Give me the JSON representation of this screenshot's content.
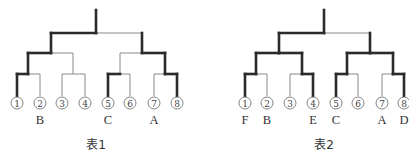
{
  "figures": [
    {
      "caption": "表1",
      "leaf_x": [
        17,
        40,
        62,
        85,
        108,
        130,
        154,
        177
      ],
      "pair_x": [
        28,
        73,
        120,
        165
      ],
      "semi_x": [
        51,
        142
      ],
      "root_x": 96,
      "seeds": [
        "1",
        "2",
        "3",
        "4",
        "5",
        "6",
        "7",
        "8"
      ],
      "teams": [
        "",
        "B",
        "",
        "",
        "C",
        "",
        "A",
        ""
      ],
      "winner_path": {
        "pairs": [
          "left",
          null,
          "left",
          "right"
        ],
        "semis": [
          "left",
          "right"
        ],
        "final": "left"
      }
    },
    {
      "caption": "表2",
      "leaf_x": [
        245,
        267,
        290,
        313,
        336,
        358,
        382,
        404
      ],
      "pair_x": [
        256,
        302,
        347,
        393
      ],
      "semi_x": [
        279,
        370
      ],
      "root_x": 324,
      "seeds": [
        "1",
        "2",
        "3",
        "4",
        "5",
        "6",
        "7",
        "8"
      ],
      "teams": [
        "F",
        "B",
        "",
        "E",
        "C",
        "",
        "A",
        "D"
      ],
      "winner_path": {
        "pairs": [
          "left",
          "right",
          "left",
          "right"
        ],
        "semis": [
          "both",
          "both"
        ],
        "final": "left"
      }
    }
  ],
  "layout": {
    "root_top_y": 10,
    "level1_y": 33,
    "level2_y": 53,
    "level3_y": 74,
    "leaf_bottom_y": 96,
    "circle_y": 103,
    "team_y": 124,
    "caption_y": 149
  },
  "colors": {
    "thick": "#2b2b2b",
    "thin": "#8a8a8a"
  }
}
